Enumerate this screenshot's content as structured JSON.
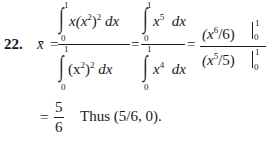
{
  "problem": {
    "number": "22.",
    "lhs": "x̄",
    "equals": "=",
    "step1": {
      "numerator": {
        "integral": "∫",
        "upper": "1",
        "lower": "0",
        "integrand": "x(x",
        "exp": "2",
        "close": ")",
        "exp2": "2",
        "dx": "dx"
      },
      "denominator": {
        "integral": "∫",
        "upper": "1",
        "lower": "0",
        "integrand": "(x",
        "exp": "2",
        "close": ")",
        "exp2": "2",
        "dx": "dx"
      }
    },
    "step2": {
      "numerator": {
        "integral": "∫",
        "upper": "1",
        "lower": "0",
        "base": "x",
        "exp": "5",
        "dx": "dx"
      },
      "denominator": {
        "integral": "∫",
        "upper": "1",
        "lower": "0",
        "base": "x",
        "exp": "4",
        "dx": "dx"
      }
    },
    "step3": {
      "numerator": {
        "open": "(x",
        "exp": "6",
        "rest": "/6)",
        "upper": "1",
        "lower": "0"
      },
      "denominator": {
        "open": "(x",
        "exp": "5",
        "rest": "/5)",
        "upper": "1",
        "lower": "0"
      }
    },
    "result": {
      "equals": "=",
      "numerator": "5",
      "denominator": "6",
      "conclusion": "Thus (5/6, 0)."
    }
  }
}
